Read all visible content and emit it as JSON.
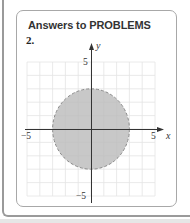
{
  "card": {
    "title": "Answers to PROBLEMS",
    "problem_number": "2."
  },
  "chart_data": {
    "type": "region",
    "title": "",
    "xlabel": "x",
    "ylabel": "y",
    "xlim": [
      -5,
      5
    ],
    "ylim": [
      -5,
      5
    ],
    "grid": true,
    "tick_labels": {
      "x": [
        "-5",
        "5"
      ],
      "y": [
        "5",
        "-5"
      ]
    },
    "shape": {
      "kind": "circle",
      "center": [
        0,
        0
      ],
      "radius": 3,
      "boundary": "dashed",
      "fill": "#c8c8c8"
    },
    "colors": {
      "fill": "#c8c8c8",
      "boundary": "#8a8a8a",
      "axis": "#333333",
      "grid": "#e4e4e4"
    }
  },
  "labels": {
    "x_axis": "x",
    "y_axis": "y",
    "x_min": "−5",
    "x_max": "5",
    "y_max": "5",
    "y_min": "−5"
  }
}
